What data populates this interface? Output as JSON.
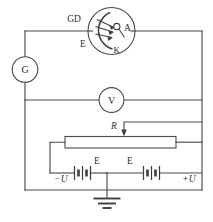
{
  "diagram": {
    "stroke_color": "#4a4a4a",
    "label_color": "#2e2e2e",
    "background": "#ffffff"
  },
  "components": {
    "galvanometer": {
      "label": "G",
      "name": "galvanometer"
    },
    "voltmeter": {
      "label": "V",
      "name": "voltmeter"
    },
    "phototube": {
      "name": "photoelectric-tube",
      "label_incident_light": "GD",
      "label_window": "E",
      "label_anode": "A",
      "label_cathode": "K"
    },
    "rheostat": {
      "label": "R",
      "name": "sliding-rheostat"
    },
    "battery_left": {
      "cell_label": "E",
      "terminal_label": "−U"
    },
    "battery_right": {
      "cell_label": "E",
      "terminal_label": "+U"
    },
    "ground": {
      "name": "earth-ground"
    }
  }
}
